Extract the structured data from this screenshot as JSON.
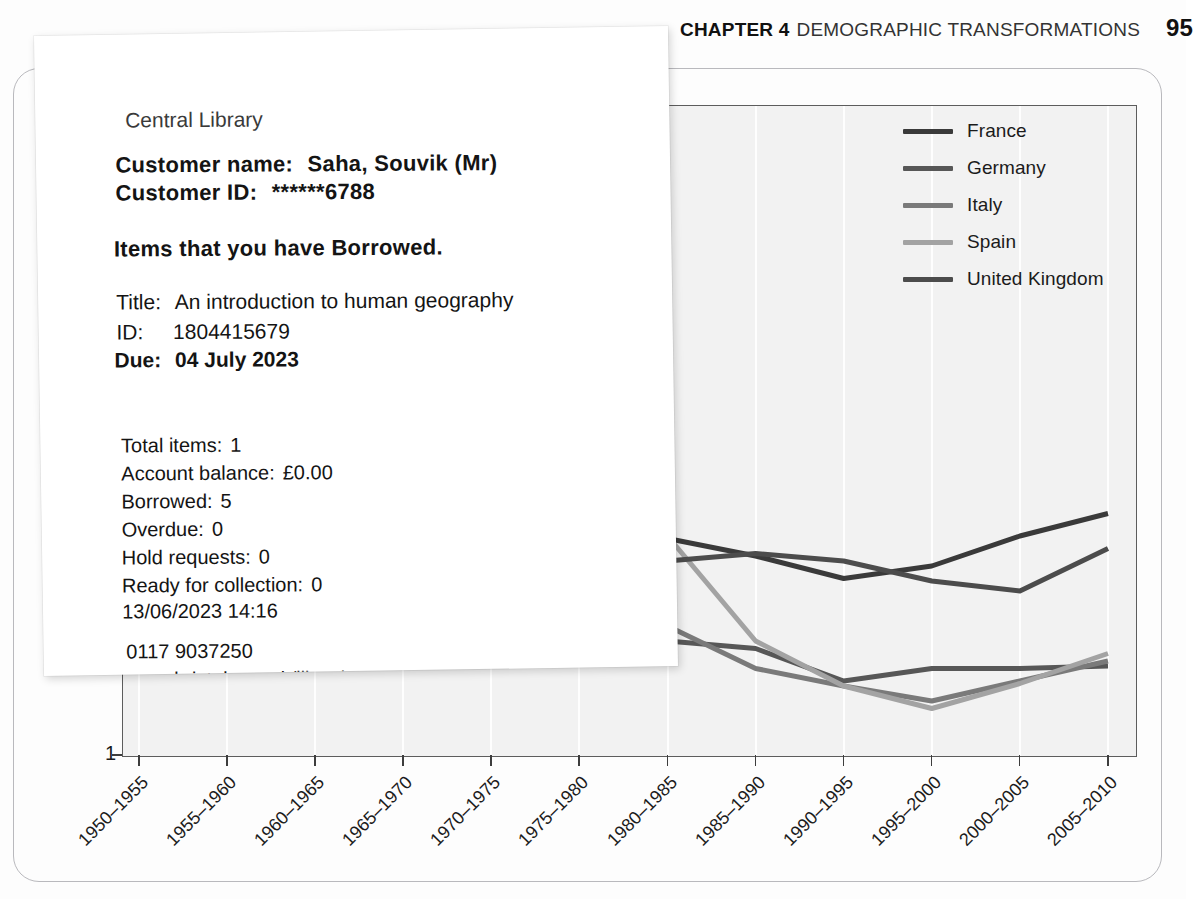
{
  "page": {
    "running_head": {
      "chapter": "CHAPTER 4",
      "title": "DEMOGRAPHIC TRANSFORMATIONS",
      "page_number": "95"
    }
  },
  "receipt": {
    "branch": "Central Library",
    "customer_name_label": "Customer name:",
    "customer_name_value": "Saha, Souvik (Mr)",
    "customer_id_label": "Customer ID:",
    "customer_id_value": "******6788",
    "section_heading": "Items that you have Borrowed.",
    "item": {
      "title_label": "Title:",
      "title_value": "An introduction to human geography",
      "id_label": "ID:",
      "id_value": "1804415679",
      "due_label": "Due:",
      "due_value": "04 July 2023"
    },
    "summary": [
      {
        "label": "Total items:",
        "value": "1"
      },
      {
        "label": "Account balance:",
        "value": "£0.00"
      },
      {
        "label": "Borrowed:",
        "value": "5"
      },
      {
        "label": "Overdue:",
        "value": "0"
      },
      {
        "label": "Hold requests:",
        "value": "0"
      },
      {
        "label": "Ready for collection:",
        "value": "0"
      }
    ],
    "timestamp": "13/06/2023 14:16",
    "phone": "0117 9037250",
    "website": "www.bristol.gov.uk/libraries"
  },
  "chart_data": {
    "type": "line",
    "title": "",
    "xlabel": "",
    "ylabel": "Total fertility rate (childr",
    "ylabel_full_visible": "Total fertility rate (childr",
    "ylim": [
      1,
      3.6
    ],
    "y_ticks": [
      "1"
    ],
    "grid": "vertical-white",
    "legend_position": "top-right",
    "categories": [
      "1950–1955",
      "1955–1960",
      "1960–1965",
      "1965–1970",
      "1970–1975",
      "1975–1980",
      "1980–1985",
      "1985–1990",
      "1990–1995",
      "1995–2000",
      "2000–2005",
      "2005–2010"
    ],
    "series": [
      {
        "name": "France",
        "color": "#3a3a3a",
        "values": [
          2.75,
          2.71,
          2.85,
          2.65,
          2.31,
          1.86,
          1.87,
          1.8,
          1.71,
          1.76,
          1.88,
          1.97
        ]
      },
      {
        "name": "Germany",
        "color": "#575757",
        "values": [
          2.16,
          2.3,
          2.49,
          2.32,
          1.64,
          1.44,
          1.46,
          1.43,
          1.3,
          1.35,
          1.35,
          1.36
        ]
      },
      {
        "name": "Italy",
        "color": "#7a7a7a",
        "values": [
          2.32,
          2.35,
          2.55,
          2.49,
          2.33,
          1.89,
          1.52,
          1.35,
          1.28,
          1.22,
          1.3,
          1.38
        ]
      },
      {
        "name": "Spain",
        "color": "#a3a3a3",
        "values": [
          2.53,
          2.75,
          2.89,
          2.92,
          2.88,
          2.57,
          1.88,
          1.46,
          1.28,
          1.19,
          1.29,
          1.41
        ]
      },
      {
        "name": "United Kingdom",
        "color": "#4c4c4c",
        "values": [
          2.18,
          2.49,
          2.81,
          2.52,
          2.04,
          1.72,
          1.78,
          1.81,
          1.78,
          1.7,
          1.66,
          1.83
        ]
      }
    ]
  }
}
